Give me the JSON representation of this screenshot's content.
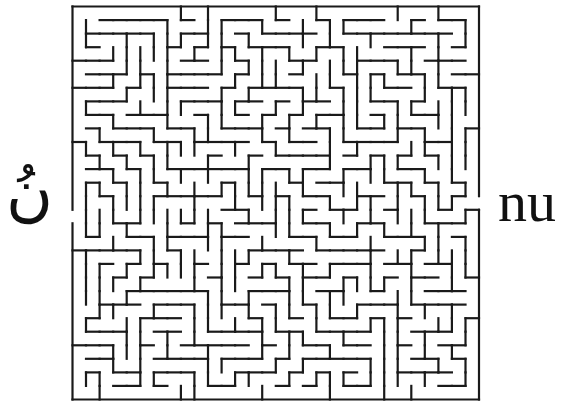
{
  "puzzle": {
    "type": "maze",
    "left_label": "نُ",
    "right_label": "nu",
    "left_label_meaning": "",
    "colors": {
      "wall": "#1a1a1a",
      "background": "#ffffff"
    }
  },
  "maze": {
    "origin_x": 72.5,
    "origin_y": 6.5,
    "cell_size": 13.55,
    "columns": 30,
    "rows": 29,
    "wall_width": 2.2,
    "entrance": {
      "side": "left",
      "row": 15
    },
    "exit": {
      "side": "right",
      "row": 14
    },
    "seed": 7321
  }
}
